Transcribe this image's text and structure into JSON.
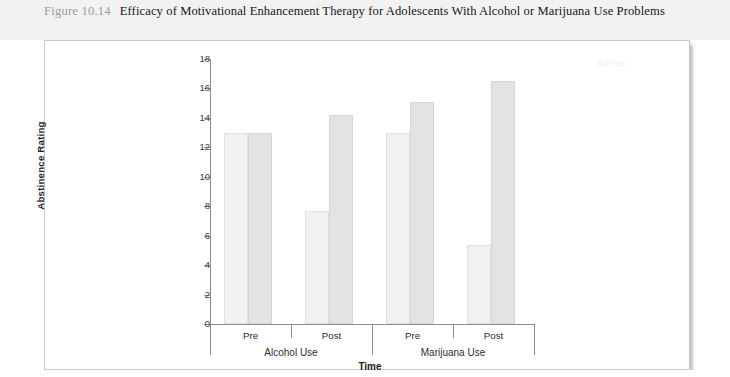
{
  "caption": {
    "figure_number": "Figure 10.14",
    "title": "Efficacy of Motivational Enhancement Therapy for Adolescents With Alcohol or Marijuana Use Problems"
  },
  "ghost_legend": "Series",
  "chart_data": {
    "type": "bar",
    "title": "",
    "xlabel": "Time",
    "ylabel": "Abstinence Rating",
    "ylim": [
      0,
      18
    ],
    "ytick_labels": [
      "0",
      "2",
      "4",
      "6",
      "8",
      "10",
      "12",
      "14",
      "16",
      "18"
    ],
    "ytick_values": [
      0,
      2,
      4,
      6,
      8,
      10,
      12,
      14,
      16,
      18
    ],
    "grid": false,
    "legend_position": "none",
    "categories": [
      "Pre",
      "Post",
      "Pre",
      "Post"
    ],
    "groups": [
      {
        "name": "Alcohol Use",
        "categories": [
          "Pre",
          "Post"
        ]
      },
      {
        "name": "Marijuana Use",
        "categories": [
          "Pre",
          "Post"
        ]
      }
    ],
    "series": [
      {
        "name": "Pre-series bar",
        "values": [
          13.0,
          7.7,
          13.0,
          5.4
        ]
      },
      {
        "name": "Post-series bar",
        "values": [
          13.0,
          14.2,
          15.1,
          16.5
        ]
      }
    ],
    "bars": [
      {
        "group": "Alcohol Use",
        "category": "Pre",
        "shade": "light",
        "value": 13.0
      },
      {
        "group": "Alcohol Use",
        "category": "Pre",
        "shade": "dark",
        "value": 13.0
      },
      {
        "group": "Alcohol Use",
        "category": "Post",
        "shade": "light",
        "value": 7.7
      },
      {
        "group": "Alcohol Use",
        "category": "Post",
        "shade": "dark",
        "value": 14.2
      },
      {
        "group": "Marijuana Use",
        "category": "Pre",
        "shade": "light",
        "value": 13.0
      },
      {
        "group": "Marijuana Use",
        "category": "Pre",
        "shade": "dark",
        "value": 15.1
      },
      {
        "group": "Marijuana Use",
        "category": "Post",
        "shade": "light",
        "value": 5.4
      },
      {
        "group": "Marijuana Use",
        "category": "Post",
        "shade": "dark",
        "value": 16.5
      }
    ],
    "colors": {
      "bar_light": "#f1f1f1",
      "bar_dark": "#e3e3e3",
      "axis": "#8d8d8d",
      "text": "#2e2e2e",
      "caption_band": "#f2f2f2",
      "figure_number": "#9b9b9b"
    }
  }
}
